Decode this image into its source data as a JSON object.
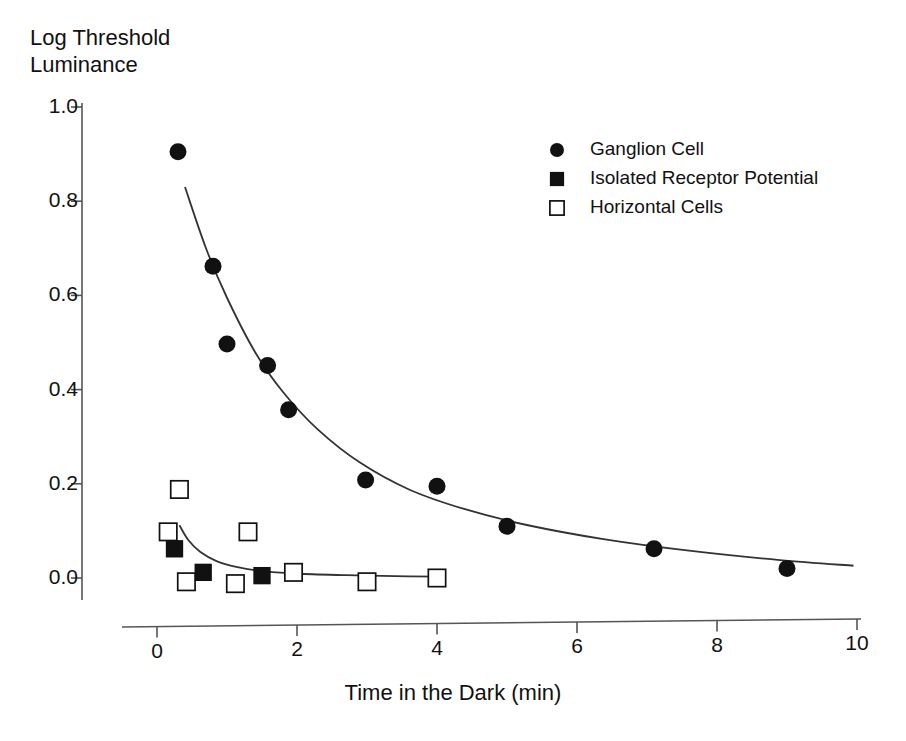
{
  "chart_data": {
    "type": "scatter",
    "title": "",
    "xlabel": "Time in the Dark (min)",
    "ylabel": "Log Threshold Luminance",
    "ylabel_lines": [
      "Log Threshold",
      "Luminance"
    ],
    "xlim": [
      0,
      10
    ],
    "ylim": [
      0.0,
      1.0
    ],
    "xticks": [
      0,
      2,
      4,
      6,
      8,
      10
    ],
    "xtick_labels": [
      "0",
      "2",
      "4",
      "6",
      "8",
      "10"
    ],
    "yticks": [
      0.0,
      0.2,
      0.4,
      0.6,
      0.8,
      1.0
    ],
    "ytick_labels": [
      "0.0",
      "0.2",
      "0.4",
      "0.6",
      "0.8",
      "1.0"
    ],
    "grid": false,
    "legend_position": "upper-right",
    "series": [
      {
        "name": "Ganglion Cell",
        "marker": "filled-circle",
        "color": "#111111",
        "points": [
          {
            "x": 0.3,
            "y": 0.905
          },
          {
            "x": 0.8,
            "y": 0.662
          },
          {
            "x": 1.0,
            "y": 0.497
          },
          {
            "x": 1.58,
            "y": 0.451
          },
          {
            "x": 1.88,
            "y": 0.357
          },
          {
            "x": 2.98,
            "y": 0.208
          },
          {
            "x": 4.0,
            "y": 0.195
          },
          {
            "x": 5.0,
            "y": 0.11
          },
          {
            "x": 7.1,
            "y": 0.062
          },
          {
            "x": 9.0,
            "y": 0.02
          }
        ],
        "fit_curve": {
          "kind": "exponential-decay",
          "points": [
            {
              "x": 0.4,
              "y": 0.83
            },
            {
              "x": 0.7,
              "y": 0.7
            },
            {
              "x": 1.0,
              "y": 0.595
            },
            {
              "x": 1.4,
              "y": 0.48
            },
            {
              "x": 1.8,
              "y": 0.395
            },
            {
              "x": 2.3,
              "y": 0.315
            },
            {
              "x": 2.9,
              "y": 0.245
            },
            {
              "x": 3.6,
              "y": 0.188
            },
            {
              "x": 4.4,
              "y": 0.146
            },
            {
              "x": 5.3,
              "y": 0.112
            },
            {
              "x": 6.4,
              "y": 0.082
            },
            {
              "x": 7.6,
              "y": 0.058
            },
            {
              "x": 8.9,
              "y": 0.038
            },
            {
              "x": 9.95,
              "y": 0.026
            }
          ]
        }
      },
      {
        "name": "Isolated Receptor Potential",
        "marker": "filled-square",
        "color": "#111111",
        "points": [
          {
            "x": 0.25,
            "y": 0.062
          },
          {
            "x": 0.66,
            "y": 0.012
          },
          {
            "x": 1.5,
            "y": 0.005
          }
        ]
      },
      {
        "name": "Horizontal Cells",
        "marker": "open-square",
        "color": "#111111",
        "points": [
          {
            "x": 0.32,
            "y": 0.188
          },
          {
            "x": 0.16,
            "y": 0.098
          },
          {
            "x": 1.3,
            "y": 0.098
          },
          {
            "x": 0.42,
            "y": -0.008
          },
          {
            "x": 1.12,
            "y": -0.012
          },
          {
            "x": 1.95,
            "y": 0.012
          },
          {
            "x": 3.0,
            "y": -0.008
          },
          {
            "x": 4.0,
            "y": 0.0
          }
        ],
        "fit_curve": {
          "kind": "exponential-decay",
          "points": [
            {
              "x": 0.32,
              "y": 0.112
            },
            {
              "x": 0.45,
              "y": 0.08
            },
            {
              "x": 0.62,
              "y": 0.055
            },
            {
              "x": 0.85,
              "y": 0.036
            },
            {
              "x": 1.15,
              "y": 0.023
            },
            {
              "x": 1.55,
              "y": 0.014
            },
            {
              "x": 2.05,
              "y": 0.009
            },
            {
              "x": 2.7,
              "y": 0.006
            },
            {
              "x": 3.4,
              "y": 0.004
            },
            {
              "x": 4.02,
              "y": 0.003
            }
          ]
        }
      }
    ]
  },
  "legend": {
    "entries": [
      {
        "label": "Ganglion Cell",
        "marker": "filled-circle"
      },
      {
        "label": "Isolated Receptor Potential",
        "marker": "filled-square"
      },
      {
        "label": "Horizontal Cells",
        "marker": "open-square"
      }
    ]
  },
  "style": {
    "axis_color": "#555555",
    "marker_color": "#111111",
    "curve_color": "#333333",
    "background": "#ffffff"
  }
}
